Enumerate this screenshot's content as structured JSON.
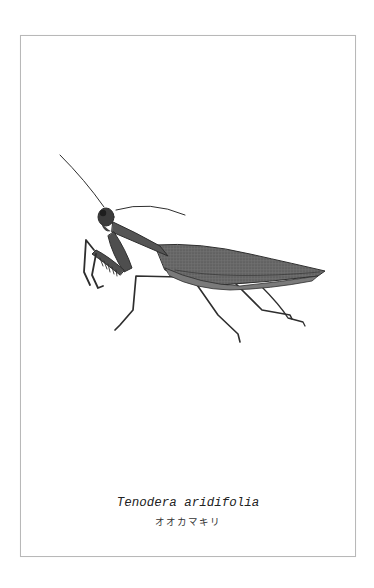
{
  "specimen": {
    "scientific_name": "Tenodera aridifolia",
    "common_name": "オオカマキリ"
  },
  "illustration": {
    "subject": "praying-mantis",
    "style": "pencil-sketch",
    "colors": {
      "body": "#5a5a5a",
      "outline": "#2e2e2e",
      "frame": "#b8b8b8",
      "background": "#ffffff"
    }
  }
}
